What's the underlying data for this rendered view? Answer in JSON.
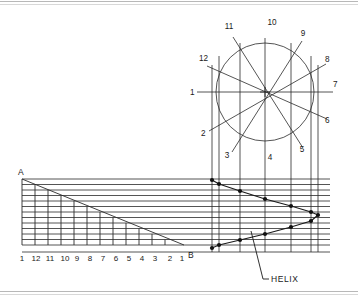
{
  "drawing": {
    "title": "Helix Construction",
    "background_color": "#ffffff",
    "line_color": "#2a2a2a",
    "text_color": "#1a1a1a",
    "border": {
      "top_visible": true,
      "bottom_visible": true
    }
  },
  "circle_view": {
    "name": "plan-view-circle",
    "center_x": 265,
    "center_y": 92,
    "radius": 49,
    "divisions": 12,
    "center_mark": "cross",
    "labels": [
      {
        "text": "1",
        "x": 190,
        "y": 95,
        "anchor": "start"
      },
      {
        "text": "2",
        "x": 201,
        "y": 136,
        "anchor": "start"
      },
      {
        "text": "3",
        "x": 227,
        "y": 158,
        "anchor": "middle"
      },
      {
        "text": "4",
        "x": 270,
        "y": 160,
        "anchor": "middle"
      },
      {
        "text": "5",
        "x": 302,
        "y": 152,
        "anchor": "middle"
      },
      {
        "text": "6",
        "x": 325,
        "y": 123,
        "anchor": "start"
      },
      {
        "text": "7",
        "x": 333,
        "y": 87,
        "anchor": "start"
      },
      {
        "text": "8",
        "x": 325,
        "y": 62,
        "anchor": "start"
      },
      {
        "text": "9",
        "x": 303,
        "y": 36,
        "anchor": "middle"
      },
      {
        "text": "10",
        "x": 272,
        "y": 25,
        "anchor": "middle"
      },
      {
        "text": "11",
        "x": 229,
        "y": 29,
        "anchor": "middle"
      },
      {
        "text": "12",
        "x": 199,
        "y": 61,
        "anchor": "start"
      }
    ]
  },
  "development_triangle": {
    "name": "development-triangle",
    "corner_a_label": "A",
    "corner_a_x": 18,
    "corner_a_y": 174,
    "corner_b_label": "B",
    "corner_b_x": 188,
    "corner_b_y": 255,
    "left_x": 22,
    "right_x": 182,
    "top_y": 179,
    "bottom_y": 245,
    "divisions": 12
  },
  "scale_labels": {
    "name": "bottom-scale",
    "items": [
      "1",
      "12",
      "11",
      "10",
      "9",
      "8",
      "7",
      "6",
      "5",
      "4",
      "3",
      "2",
      "1"
    ],
    "y": 260
  },
  "helix": {
    "name": "helix-curve",
    "label": "HELIX",
    "label_x": 268,
    "label_y": 283,
    "leader_from_x": 262,
    "leader_from_y": 279,
    "leader_to_x": 251,
    "leader_to_y": 238,
    "points": [
      {
        "x": 212,
        "y": 180
      },
      {
        "x": 219,
        "y": 184
      },
      {
        "x": 240,
        "y": 191
      },
      {
        "x": 265,
        "y": 199
      },
      {
        "x": 291,
        "y": 206
      },
      {
        "x": 311,
        "y": 212
      },
      {
        "x": 318,
        "y": 215
      },
      {
        "x": 311,
        "y": 221
      },
      {
        "x": 291,
        "y": 227
      },
      {
        "x": 265,
        "y": 234
      },
      {
        "x": 240,
        "y": 240
      },
      {
        "x": 219,
        "y": 245
      },
      {
        "x": 212,
        "y": 248
      }
    ]
  },
  "projection_lines": {
    "name": "vertical-projection-lines",
    "x_positions": [
      212,
      219,
      240,
      265,
      291,
      311,
      318
    ],
    "top_y": 43,
    "bottom_y": 252
  },
  "horizontal_lines": {
    "name": "horizontal-generator-lines",
    "count": 13,
    "left_x": 22,
    "right_x": 330,
    "top_y": 179,
    "bottom_y": 245
  }
}
